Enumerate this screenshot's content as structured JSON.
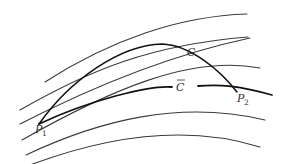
{
  "diagram": {
    "labels": {
      "curve_c": "C",
      "curve_cbar": "C",
      "point_1": "P",
      "point_1_sub": "1",
      "point_2": "P",
      "point_2_sub": "2"
    },
    "colors": {
      "background": "#ffffff",
      "lines": "#3a3a3a",
      "highlight_curves": "#111111"
    }
  }
}
